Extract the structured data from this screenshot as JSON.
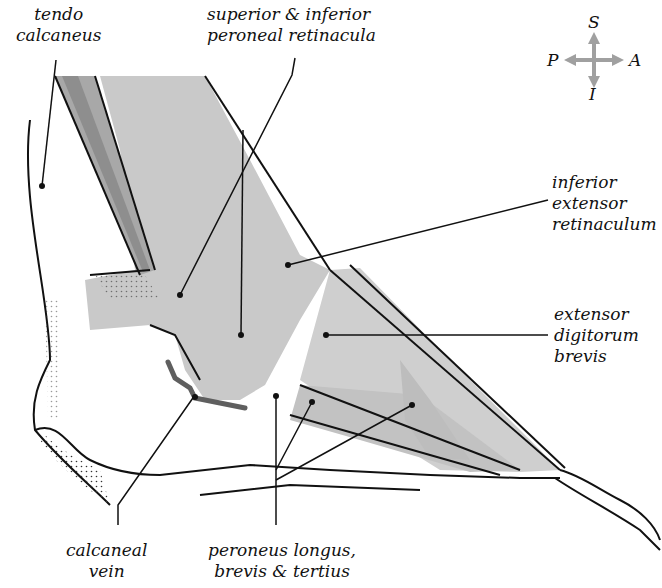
{
  "diagram": {
    "colors": {
      "tissue_gray": "#c9c9c9",
      "tendon_dark": "#a8a8a8",
      "vein": "#6a6a6a",
      "line": "#111111",
      "arrow_gray": "#a0a0a0"
    },
    "orientation": {
      "superior": "S",
      "inferior": "I",
      "posterior": "P",
      "anterior": "A"
    },
    "labels": [
      {
        "id": "tendo-calcaneus",
        "lines": [
          "tendo",
          "calcaneus"
        ]
      },
      {
        "id": "peroneal-retinacula",
        "lines": [
          "superior & inferior",
          "peroneal retinacula"
        ]
      },
      {
        "id": "inferior-extensor-retinaculum",
        "lines": [
          "inferior",
          "extensor",
          "retinaculum"
        ]
      },
      {
        "id": "extensor-digitorum-brevis",
        "lines": [
          "extensor",
          "digitorum",
          "brevis"
        ]
      },
      {
        "id": "calcaneal-vein",
        "lines": [
          "calcaneal",
          "vein"
        ]
      },
      {
        "id": "peroneus-tendons",
        "lines": [
          "peroneus longus,",
          "brevis & tertius"
        ]
      }
    ]
  }
}
